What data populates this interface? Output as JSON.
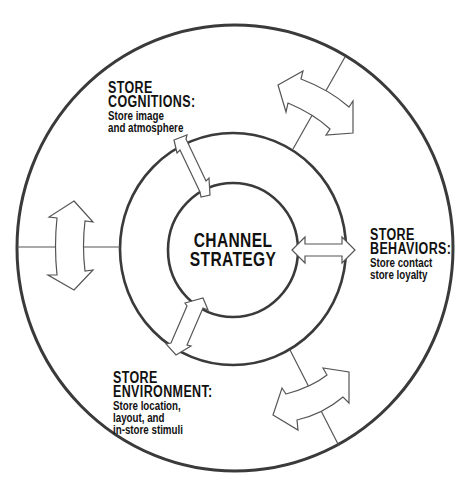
{
  "diagram": {
    "center": {
      "lines": [
        "CHANNEL",
        "STRATEGY"
      ]
    },
    "labels": {
      "cognitions": {
        "heading": [
          "STORE",
          "COGNITIONS:"
        ],
        "description": [
          "Store image",
          "and atmosphere"
        ]
      },
      "behaviors": {
        "heading": [
          "STORE",
          "BEHAVIORS:"
        ],
        "description": [
          "Store contact",
          "store loyalty"
        ]
      },
      "environment": {
        "heading": [
          "STORE",
          "ENVIRONMENT:"
        ],
        "description": [
          "Store location,",
          "layout, and",
          "in-store stimuli"
        ]
      }
    },
    "colors": {
      "stroke": "#3a3a3a",
      "arrow_stroke": "#555555",
      "fill": "#ffffff",
      "text": "#111111"
    }
  }
}
